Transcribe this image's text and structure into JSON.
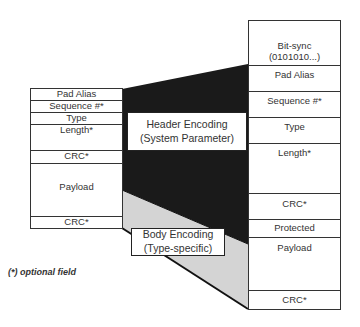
{
  "left_frame": {
    "fields": [
      {
        "label": "Pad Alias"
      },
      {
        "label": "Sequence #*"
      },
      {
        "label": "Type"
      },
      {
        "label": "Length*"
      },
      {
        "label": "CRC*"
      },
      {
        "label": "Payload"
      },
      {
        "label": "CRC*"
      }
    ]
  },
  "right_frame": {
    "fields": [
      {
        "label": "Bit-sync",
        "label2": "(0101010...)"
      },
      {
        "label": "Pad Alias"
      },
      {
        "label": "Sequence #*"
      },
      {
        "label": "Type"
      },
      {
        "label": "Length*"
      },
      {
        "label": "CRC*"
      },
      {
        "label": "Protected"
      },
      {
        "label": "Payload"
      },
      {
        "label": "CRC*"
      }
    ]
  },
  "labels": {
    "header_encoding": {
      "line1": "Header Encoding",
      "line2": "(System Parameter)"
    },
    "body_encoding": {
      "line1": "Body Encoding",
      "line2": "(Type-specific)"
    }
  },
  "footnote": "(*) optional field",
  "colors": {
    "header_fill": "#1a1a1a",
    "body_fill": "#d6d6d6",
    "line": "#333333"
  }
}
